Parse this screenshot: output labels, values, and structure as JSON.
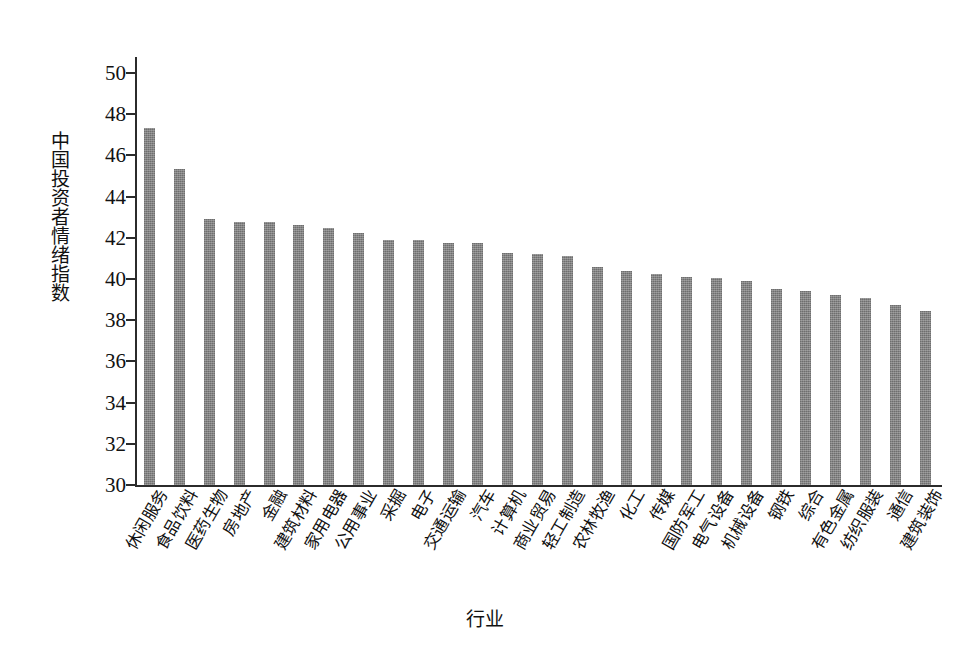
{
  "chart_data": {
    "type": "bar",
    "title": "",
    "xlabel": "行业",
    "ylabel": "中国投资者情绪指数",
    "ylim": [
      30,
      50
    ],
    "yticks": [
      30,
      32,
      34,
      36,
      38,
      40,
      42,
      44,
      46,
      48,
      50
    ],
    "grid": false,
    "legend": null,
    "bar_color": "#7d7d7d",
    "axis_color": "#2b2b2b",
    "categories": [
      "休闲服务",
      "食品饮料",
      "医药生物",
      "房地产",
      "金融",
      "建筑材料",
      "家用电器",
      "公用事业",
      "采掘",
      "电子",
      "交通运输",
      "汽车",
      "计算机",
      "商业贸易",
      "轻工制造",
      "农林牧渔",
      "化工",
      "传媒",
      "国防军工",
      "电气设备",
      "机械设备",
      "钢铁",
      "综合",
      "有色金属",
      "纺织服装",
      "通信",
      "建筑装饰"
    ],
    "values": [
      47.35,
      45.35,
      42.9,
      42.75,
      42.75,
      42.6,
      42.5,
      42.25,
      41.9,
      41.9,
      41.75,
      41.75,
      41.25,
      41.2,
      41.1,
      40.6,
      40.4,
      40.25,
      40.1,
      40.05,
      39.9,
      39.5,
      39.4,
      39.2,
      39.1,
      38.75,
      38.45
    ]
  }
}
